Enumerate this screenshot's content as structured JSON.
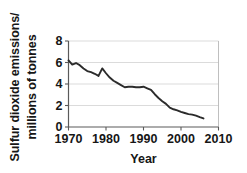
{
  "chart_data": {
    "type": "line",
    "title": "",
    "subtitle": "",
    "xlabel": "Year",
    "ylabel": "Sulfur dioxide emissions/ millions of tonnes",
    "ylabel_line1": "Sulfur dioxide emissions/",
    "ylabel_line2": "millions of tonnes",
    "xlim": [
      1970,
      2010
    ],
    "ylim": [
      0,
      8
    ],
    "xticks": [
      1970,
      1980,
      1990,
      2000,
      2010
    ],
    "xticklabels": [
      "1970",
      "1980",
      "1990",
      "2000",
      "2010"
    ],
    "yticks": [
      0,
      2,
      4,
      6,
      8
    ],
    "yticklabels": [
      "0",
      "2",
      "4",
      "6",
      "8"
    ],
    "grid": "horizontal",
    "legend": "none",
    "line_color": "#2b2b2b",
    "grid_color": "#d2d2d2",
    "axis_color": "#5a5a5a",
    "background_color": "#ffffff",
    "series": [
      {
        "name": "Sulfur dioxide emissions",
        "x": [
          1970,
          1971,
          1972,
          1973,
          1974,
          1975,
          1976,
          1977,
          1978,
          1979,
          1980,
          1981,
          1982,
          1983,
          1984,
          1985,
          1986,
          1987,
          1988,
          1989,
          1990,
          1991,
          1992,
          1993,
          1994,
          1995,
          1996,
          1997,
          1998,
          1999,
          2000,
          2001,
          2002,
          2003,
          2004,
          2005,
          2006
        ],
        "values": [
          6.2,
          5.8,
          5.95,
          5.75,
          5.45,
          5.2,
          5.1,
          4.95,
          4.75,
          5.45,
          5.0,
          4.6,
          4.3,
          4.1,
          3.9,
          3.7,
          3.75,
          3.75,
          3.7,
          3.7,
          3.75,
          3.6,
          3.45,
          3.05,
          2.7,
          2.4,
          2.15,
          1.8,
          1.65,
          1.55,
          1.4,
          1.3,
          1.2,
          1.15,
          1.05,
          0.92,
          0.8
        ]
      }
    ]
  },
  "axis": {
    "ylabel_line1": "Sulfur dioxide emissions/",
    "ylabel_line2": "millions of tonnes",
    "xlabel": "Year"
  }
}
